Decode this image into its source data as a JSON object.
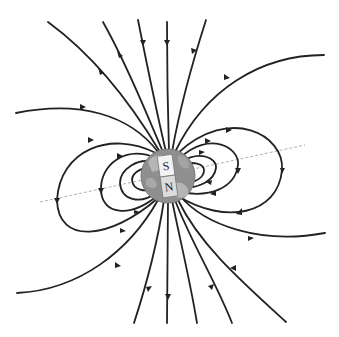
{
  "diagram": {
    "title": "",
    "magnet": {
      "top_pole_label": "S",
      "bottom_pole_label": "N"
    },
    "colors": {
      "field_line": "#222222",
      "earth_fill": "#8f8f8f",
      "earth_land": "#b5b5b5",
      "magnet_fill": "#f2f2f2",
      "axis_line": "#9a9a9a"
    },
    "field_line_direction": "arrows point from lower hemisphere (N) around and into upper hemisphere (S)"
  }
}
